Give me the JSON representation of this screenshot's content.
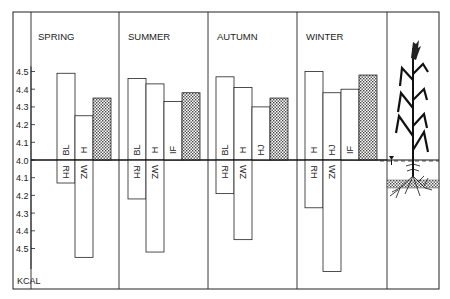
{
  "chart_data": {
    "type": "bar",
    "title": "",
    "ylabel": "KCAL",
    "xlabel": "",
    "baseline": 4.0,
    "ylim_up": [
      4.0,
      4.5
    ],
    "ylim_down": [
      4.0,
      4.5
    ],
    "yticks_up": [
      "4.5",
      "4.4",
      "4.3",
      "4.2",
      "4.1",
      "4.0"
    ],
    "yticks_down": [
      "4.1",
      "4.2",
      "4.3",
      "4.4",
      "4.5"
    ],
    "grid": false,
    "panels": [
      {
        "season": "SPRING",
        "up": [
          {
            "label": "BL",
            "value": 4.49,
            "style": "open"
          },
          {
            "label": "H",
            "value": 4.25,
            "style": "open"
          },
          {
            "label": "",
            "value": 4.35,
            "style": "hatched"
          }
        ],
        "down": [
          {
            "label": "RH",
            "value": 4.13,
            "col": 0
          },
          {
            "label": "WZ",
            "value": 4.55,
            "col": 1
          }
        ]
      },
      {
        "season": "SUMMER",
        "up": [
          {
            "label": "BL",
            "value": 4.46,
            "style": "open"
          },
          {
            "label": "H",
            "value": 4.43,
            "style": "open"
          },
          {
            "label": "IF",
            "value": 4.33,
            "style": "open"
          },
          {
            "label": "",
            "value": 4.38,
            "style": "hatched"
          }
        ],
        "down": [
          {
            "label": "RH",
            "value": 4.22,
            "col": 0
          },
          {
            "label": "WZ",
            "value": 4.52,
            "col": 1
          }
        ]
      },
      {
        "season": "AUTUMN",
        "up": [
          {
            "label": "BL",
            "value": 4.47,
            "style": "open"
          },
          {
            "label": "H",
            "value": 4.41,
            "style": "open"
          },
          {
            "label": "HJ",
            "value": 4.3,
            "style": "open"
          },
          {
            "label": "",
            "value": 4.35,
            "style": "hatched"
          }
        ],
        "down": [
          {
            "label": "RH",
            "value": 4.19,
            "col": 0
          },
          {
            "label": "WZ",
            "value": 4.45,
            "col": 1
          }
        ]
      },
      {
        "season": "WINTER",
        "up": [
          {
            "label": "H",
            "value": 4.5,
            "style": "open"
          },
          {
            "label": "HJ",
            "value": 4.38,
            "style": "open"
          },
          {
            "label": "IF",
            "value": 4.4,
            "style": "open"
          },
          {
            "label": "",
            "value": 4.48,
            "style": "hatched"
          }
        ],
        "down": [
          {
            "label": "RH",
            "value": 4.27,
            "col": 0
          },
          {
            "label": "WZ",
            "value": 4.63,
            "col": 1
          }
        ]
      }
    ],
    "illustration": "plant-with-water-table"
  },
  "colors": {
    "line": "#222222",
    "hatch": "#555555",
    "background": "#ffffff"
  }
}
